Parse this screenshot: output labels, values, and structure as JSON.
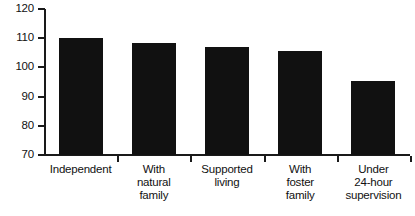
{
  "chart_data": {
    "type": "bar",
    "title": "",
    "subtitle": "",
    "xlabel": "",
    "ylabel": "",
    "categories": [
      "Independent",
      "With\nnatural\nfamily",
      "Supported\nliving",
      "With\nfoster\nfamily",
      "Under\n24-hour\nsupervision"
    ],
    "values": [
      110,
      108.5,
      107,
      105.5,
      95.5
    ],
    "ylim": [
      70,
      120
    ],
    "yticks": [
      70,
      80,
      90,
      100,
      110,
      120
    ],
    "ytick_labels": [
      "70",
      "80",
      "90",
      "100",
      "110",
      "120"
    ],
    "grid": false,
    "legend": false,
    "legend_position": "none",
    "bar_color": "#111111",
    "axis_color": "#1a1a1a",
    "background_color": "#ffffff"
  }
}
